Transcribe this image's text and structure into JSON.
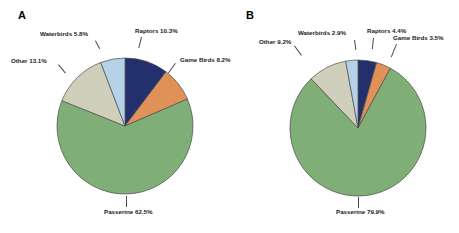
{
  "figure": {
    "background_color": "#ffffff",
    "panels": [
      {
        "letter": "A",
        "labels": {
          "waterbirds": "Waterbirds 5.8%",
          "raptors": "Raptors 10.3%",
          "game_birds": "Game Birds 8.2%",
          "other": "Other 13.1%",
          "passerine": "Passerine 62.5%"
        }
      },
      {
        "letter": "B",
        "labels": {
          "waterbirds": "Waterbirds 2.9%",
          "raptors": "Raptors 4.4%",
          "game_birds": "Game Birds 3.5%",
          "other": "Other 9.2%",
          "passerine": "Passerine 79.9%"
        }
      }
    ]
  },
  "colors": {
    "raptors": "#22306e",
    "game_birds": "#e09158",
    "passerine": "#7fae77",
    "other": "#cfcfbb",
    "waterbirds": "#b6d2e8",
    "slice_outline": "#4a4a4a",
    "text": "#1a1a1a"
  },
  "chart_data": [
    {
      "type": "pie",
      "title": "A",
      "xlabel": "",
      "ylabel": "",
      "legend_position": "none",
      "grid": false,
      "start_angle_deg": 0,
      "direction": "clockwise",
      "categories": [
        "Raptors",
        "Game Birds",
        "Passerine",
        "Other",
        "Waterbirds"
      ],
      "values": [
        10.3,
        8.2,
        62.5,
        13.1,
        5.8
      ],
      "unit": "%",
      "colors": [
        "#22306e",
        "#e09158",
        "#7fae77",
        "#cfcfbb",
        "#b6d2e8"
      ],
      "annotations": [
        "Raptors 10.3%",
        "Game Birds 8.2%",
        "Passerine 62.5%",
        "Other 13.1%",
        "Waterbirds 5.8%"
      ]
    },
    {
      "type": "pie",
      "title": "B",
      "xlabel": "",
      "ylabel": "",
      "legend_position": "none",
      "grid": false,
      "start_angle_deg": 0,
      "direction": "clockwise",
      "categories": [
        "Raptors",
        "Game Birds",
        "Passerine",
        "Other",
        "Waterbirds"
      ],
      "values": [
        4.4,
        3.5,
        79.9,
        9.2,
        2.9
      ],
      "unit": "%",
      "colors": [
        "#22306e",
        "#e09158",
        "#7fae77",
        "#cfcfbb",
        "#b6d2e8"
      ],
      "annotations": [
        "Raptors 4.4%",
        "Game Birds 3.5%",
        "Passerine 79.9%",
        "Other 9.2%",
        "Waterbirds 2.9%"
      ]
    }
  ]
}
